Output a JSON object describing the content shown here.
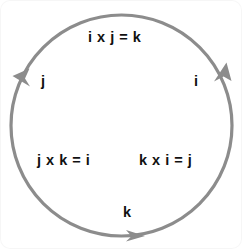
{
  "diagram": {
    "circle": {
      "center_x": 121.5,
      "center_y": 125.5,
      "radius": 110.5,
      "stroke_color": "#8c8c8c",
      "stroke_width": 3.2,
      "direction": "counterclockwise"
    },
    "background_color": "#ffffff",
    "text_color": "#111111",
    "labels": {
      "top_equation": "i x j = k",
      "left_unit": "j",
      "right_unit": "i",
      "bottom_left_equation": "j x k = i",
      "bottom_right_equation": "k x i = j",
      "bottom_unit": "k"
    },
    "arrowheads": [
      {
        "name": "arrowhead-left",
        "angle_deg": 200,
        "points": "down-left"
      },
      {
        "name": "arrowhead-bottom",
        "angle_deg": 85,
        "points": "right"
      },
      {
        "name": "arrowhead-right",
        "angle_deg": 20,
        "points": "up"
      }
    ]
  }
}
